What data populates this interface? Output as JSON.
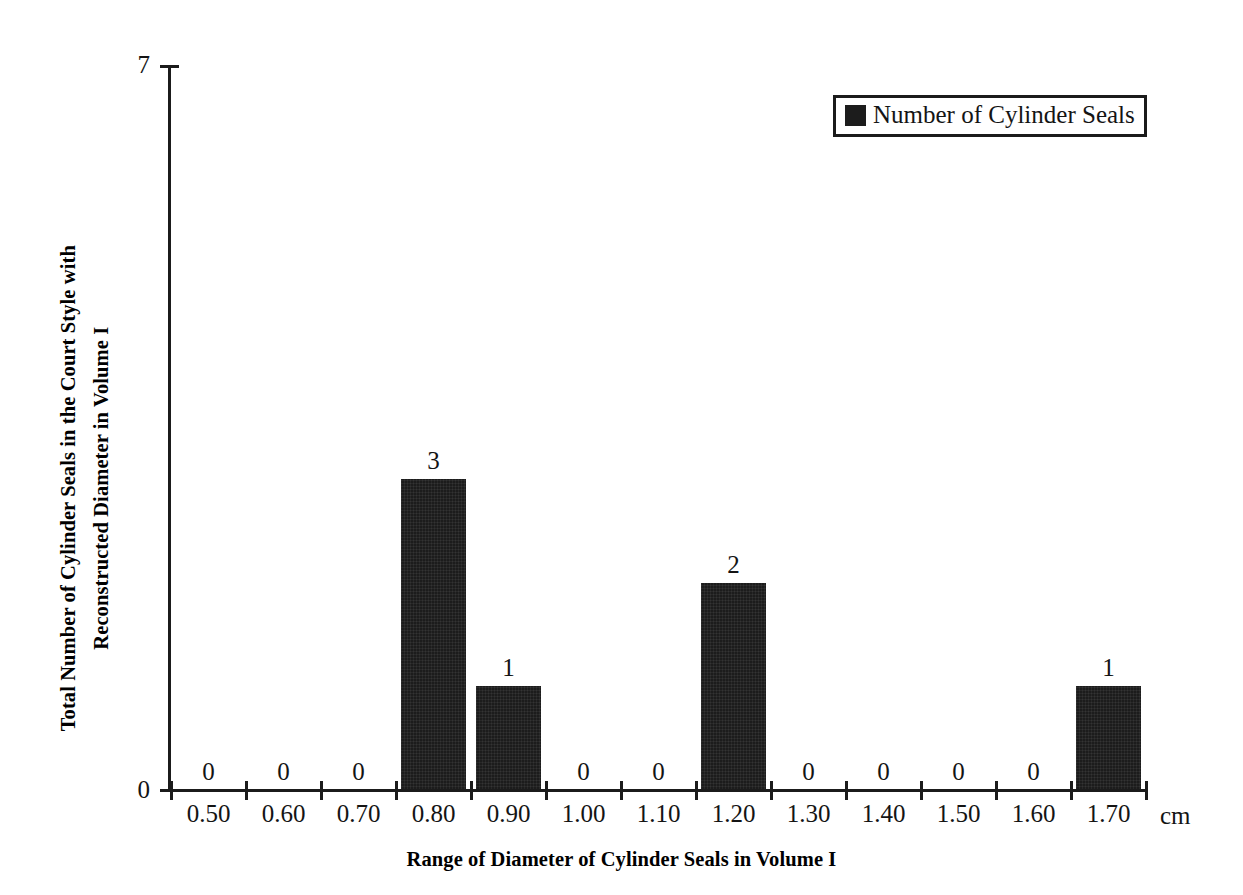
{
  "chart_data": {
    "type": "bar",
    "title": "",
    "xlabel": "Range of Diameter of Cylinder Seals in Volume I",
    "ylabel": "Total Number of Cylinder Seals in the Court Style with Reconstructed Diameter in Volume I",
    "ylabel_line1": "Total Number of Cylinder Seals in the Court Style with",
    "ylabel_line2": "Reconstructed Diameter in Volume I",
    "x_unit": "cm",
    "categories": [
      "0.50",
      "0.60",
      "0.70",
      "0.80",
      "0.90",
      "1.00",
      "1.10",
      "1.20",
      "1.30",
      "1.40",
      "1.50",
      "1.60",
      "1.70"
    ],
    "values": [
      0,
      0,
      0,
      3,
      1,
      0,
      0,
      2,
      0,
      0,
      0,
      0,
      1
    ],
    "data_labels": [
      "0",
      "0",
      "0",
      "3",
      "1",
      "0",
      "0",
      "2",
      "0",
      "0",
      "0",
      "0",
      "1"
    ],
    "ylim": [
      0,
      7
    ],
    "y_tick_labels": [
      "0",
      "7"
    ],
    "y_ticks": [
      0,
      7
    ],
    "grid": false,
    "legend_position": "top-right",
    "series": [
      {
        "name": "Number of Cylinder Seals",
        "color": "#1c1c1c",
        "values": [
          0,
          0,
          0,
          3,
          1,
          0,
          0,
          2,
          0,
          0,
          0,
          0,
          1
        ]
      }
    ]
  },
  "legend": {
    "label": "Number of Cylinder Seals",
    "swatch_color": "#1c1c1c"
  },
  "axes": {
    "y_top_label": "7",
    "y_bottom_label": "0",
    "axis_color": "#1b1b1b"
  }
}
